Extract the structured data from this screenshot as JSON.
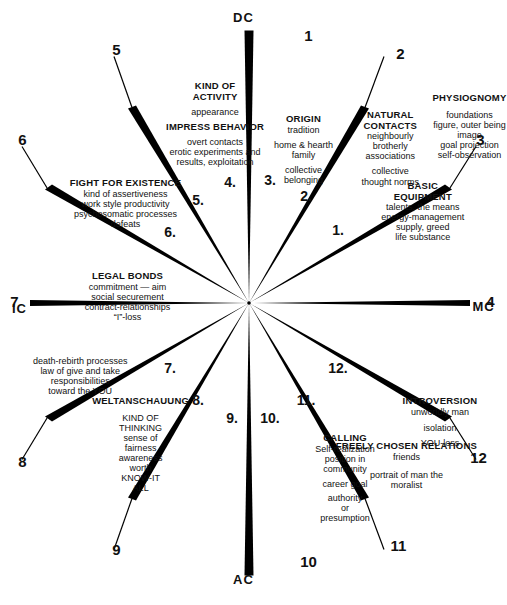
{
  "diagram": {
    "center_marker": "center-dot",
    "axis_labels": [
      {
        "id": "ac",
        "text": "AC"
      },
      {
        "id": "ic",
        "text": "IC"
      },
      {
        "id": "mc",
        "text": "MC"
      },
      {
        "id": "dc",
        "text": "DC"
      }
    ],
    "house_numbers": [
      "1.",
      "2.",
      "3.",
      "4.",
      "5.",
      "6.",
      "7.",
      "8.",
      "9.",
      "10.",
      "11.",
      "12."
    ],
    "cusp_numbers": [
      "1",
      "2",
      "3",
      "4",
      "5",
      "6",
      "7",
      "8",
      "9",
      "10",
      "11",
      "12"
    ],
    "houses": [
      {
        "number": "1.",
        "cusp": "1",
        "title": "PHYSIOGNOMY",
        "lines": [
          "foundations",
          "figure, outer being",
          "image",
          "goal projection",
          "self-observation"
        ]
      },
      {
        "number": "2.",
        "cusp": "2",
        "title": "BASIC EQUIPMENT",
        "lines": [
          "talents, the means",
          "energy-management",
          "supply, greed",
          "life substance"
        ]
      },
      {
        "number": "3.",
        "cusp": "3",
        "title": "NATURAL CONTACTS",
        "lines": [
          "neighbourly",
          "brotherly",
          "associations",
          "collective",
          "thought norms"
        ]
      },
      {
        "number": "4.",
        "cusp": "4",
        "title": "ORIGIN",
        "lines": [
          "tradition",
          "home & hearth",
          "family",
          "collective",
          "belonging"
        ]
      },
      {
        "number": "5.",
        "cusp": "5",
        "title": "KIND OF ACTIVITY",
        "lines": [
          "appearance",
          "IMPRESS BEHAVIOR",
          "overt contacts",
          "erotic experiments and",
          "results, exploitation"
        ]
      },
      {
        "number": "6.",
        "cusp": "6",
        "title": "FIGHT FOR EXISTENCE",
        "lines": [
          "kind of assertiveness",
          "work style productivity",
          "psychosomatic processes",
          "defeats"
        ]
      },
      {
        "number": "7.",
        "cusp": "7",
        "title": "LEGAL BONDS",
        "lines": [
          "commitment — aim",
          "social securement",
          "contract-relationships",
          "“I”-loss"
        ]
      },
      {
        "number": "8.",
        "cusp": "8",
        "title": "",
        "lines": [
          "death-rebirth processes",
          "law of give and take",
          "responsibilities",
          "toward the YOU"
        ]
      },
      {
        "number": "9.",
        "cusp": "9",
        "title": "WELTANSCHAUUNG",
        "lines": [
          "KIND OF THINKING",
          "sense of fairness",
          "awareness",
          "worth",
          "KNOW-IT ALL"
        ]
      },
      {
        "number": "10.",
        "cusp": "10",
        "title": "CALLING",
        "lines": [
          "Self-realization",
          "position in community",
          "career goal",
          "authority",
          "or",
          "presumption"
        ]
      },
      {
        "number": "11.",
        "cusp": "11",
        "title": "FREELY CHOSEN RELATIONS",
        "lines": [
          "friends",
          "portrait of man the",
          "moralist"
        ]
      },
      {
        "number": "12.",
        "cusp": "12",
        "title": "INTROVERSION",
        "lines": [
          "unworldly man",
          "isolation",
          "YOU-loss"
        ]
      }
    ],
    "text_blocks": {
      "h9_title": "WELTANSCHAUUNG",
      "h9_a": "KIND OF",
      "h9_b": "THINKING",
      "h9_c": "sense of",
      "h9_d": "fairness",
      "h9_e": "awareness",
      "h9_f": "worth",
      "h9_g": "KNOW-IT",
      "h9_h": "ALL",
      "h8_a": "death-rebirth processes",
      "h8_b": "law of give and take",
      "h8_c": "responsibilities",
      "h8_d": "toward the YOU",
      "h7_title": "LEGAL BONDS",
      "h7_a": "commitment — aim",
      "h7_b": "social securement",
      "h7_c": "contract-relationships",
      "h7_d": "“I”-loss",
      "h6_title": "FIGHT FOR EXISTENCE",
      "h6_a": "kind of assertiveness",
      "h6_b": "work style productivity",
      "h6_c": "psychosomatic processes",
      "h6_d": "defeats",
      "h5_a": "KIND OF",
      "h5_b": "ACTIVITY",
      "h5_c": "appearance",
      "h5_d": "IMPRESS BEHAVIOR",
      "h5_e": "overt contacts",
      "h5_f": "erotic experiments and",
      "h5_g": "results, exploitation",
      "h4_title": "ORIGIN",
      "h4_a": "tradition",
      "h4_b": "home & hearth",
      "h4_c": "family",
      "h4_d": "collective",
      "h4_e": "belonging",
      "h3_a": "NATURAL",
      "h3_b": "CONTACTS",
      "h3_c": "neighbourly",
      "h3_d": "brotherly",
      "h3_e": "associations",
      "h3_f": "collective",
      "h3_g": "thought norms",
      "h2_a": "BASIC",
      "h2_b": "EQUIPMENT",
      "h2_c": "talents, the means",
      "h2_d": "energy-management",
      "h2_e": "supply, greed",
      "h2_f": "life substance",
      "h1_title": "PHYSIOGNOMY",
      "h1_a": "foundations",
      "h1_b": "figure, outer being",
      "h1_c": "image",
      "h1_d": "goal projection",
      "h1_e": "self-observation",
      "h12_title": "INTROVERSION",
      "h12_a": "unworldly man",
      "h12_b": "isolation",
      "h12_c": "YOU-loss",
      "h11_title": "FREELY CHOSEN RELATIONS",
      "h11_a": "friends",
      "h11_b": "portrait of man the",
      "h11_c": "moralist",
      "h10_title": "CALLING",
      "h10_a": "Self-realization",
      "h10_b": "position in",
      "h10_c": "community",
      "h10_d": "career goal",
      "h10_e": "authority",
      "h10_f": "or",
      "h10_g": "presumption"
    },
    "numbers": {
      "n1": "1.",
      "n2": "2.",
      "n3": "3.",
      "n4": "4.",
      "n5": "5.",
      "n6": "6.",
      "n7": "7.",
      "n8": "8.",
      "n9": "9.",
      "n10": "10.",
      "n11": "11.",
      "n12": "12.",
      "c1": "1",
      "c2": "2",
      "c3": "3",
      "c4": "4",
      "c5": "5",
      "c6": "6",
      "c7": "7",
      "c8": "8",
      "c9": "9",
      "c10": "10",
      "c11": "11",
      "c12": "12"
    },
    "axes": {
      "ac": "AC",
      "ic": "IC",
      "mc": "MC",
      "dc": "DC"
    },
    "colors": {
      "ink": "#000000",
      "background": "#ffffff"
    }
  }
}
